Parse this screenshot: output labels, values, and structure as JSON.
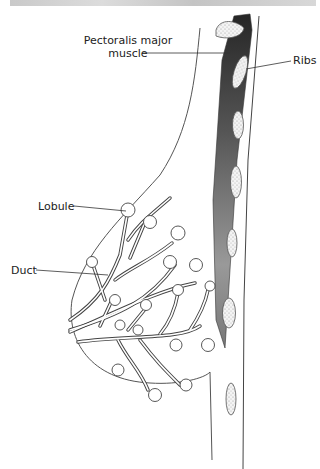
{
  "figure": {
    "type": "anatomical-diagram",
    "labels": {
      "pectoralis_line1": "Pectoralis major",
      "pectoralis_line2": "muscle",
      "ribs": "Ribs",
      "lobule": "Lobule",
      "duct": "Duct"
    },
    "colors": {
      "line": "#333333",
      "muscle_dark": "#2a2a2a",
      "muscle_light": "#bdbdbd",
      "rib_fill": "#f2f2f2",
      "background": "#ffffff"
    }
  }
}
